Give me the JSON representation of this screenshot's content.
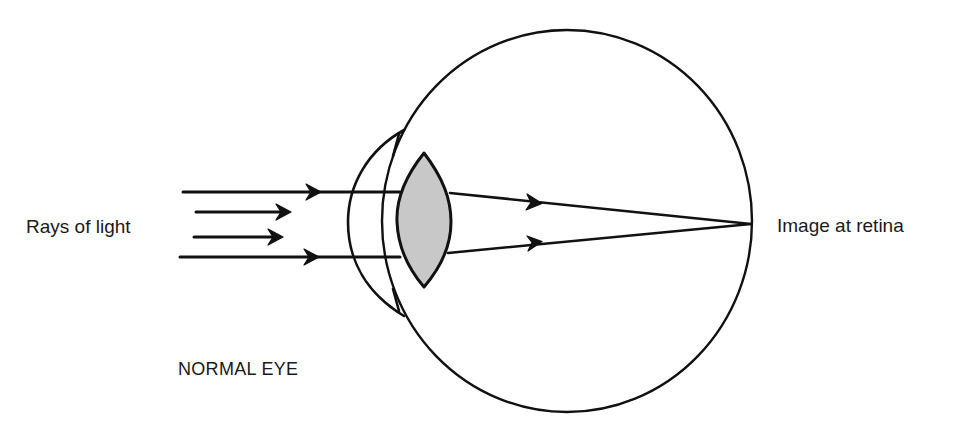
{
  "diagram": {
    "title": "NORMAL EYE",
    "labels": {
      "input": "Rays of light",
      "output": "Image at retina",
      "caption": "NORMAL EYE"
    },
    "colors": {
      "stroke": "#111111",
      "lens_fill": "#c8c8c8",
      "background": "#ffffff",
      "text": "#1a1a1a"
    },
    "parts": [
      {
        "name": "eyeball",
        "shape": "circle",
        "cx": 567,
        "cy": 221,
        "r": 188
      },
      {
        "name": "cornea",
        "shape": "arc"
      },
      {
        "name": "lens",
        "shape": "biconvex",
        "fill": "#c8c8c8"
      },
      {
        "name": "retina",
        "point": [
          751,
          224
        ]
      }
    ],
    "rays": [
      {
        "id": "outer-top",
        "from": [
          183,
          192
        ],
        "to": [
          751,
          224
        ],
        "arrows": 2
      },
      {
        "id": "inner-top",
        "from": [
          196,
          212
        ],
        "to": [
          290,
          212
        ],
        "arrows": 1
      },
      {
        "id": "inner-bottom",
        "from": [
          194,
          237
        ],
        "to": [
          282,
          237
        ],
        "arrows": 1
      },
      {
        "id": "outer-bottom",
        "from": [
          180,
          257
        ],
        "to": [
          751,
          224
        ],
        "arrows": 2
      }
    ]
  }
}
